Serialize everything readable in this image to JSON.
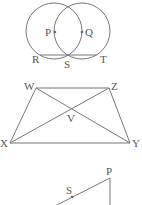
{
  "figures": [
    {
      "id": "two-circles",
      "labels": {
        "P": "P",
        "Q": "Q",
        "R": "R",
        "S": "S",
        "T": "T"
      }
    },
    {
      "id": "trapezium",
      "labels": {
        "W": "W",
        "Z": "Z",
        "V": "V",
        "X": "X",
        "Y": "Y"
      }
    },
    {
      "id": "partial-triangle",
      "labels": {
        "P": "P",
        "S": "S"
      }
    }
  ],
  "colors": {
    "stroke": "#777777",
    "text": "#555555",
    "background": "#ffffff"
  }
}
